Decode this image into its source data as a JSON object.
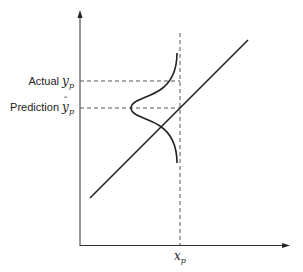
{
  "diagram": {
    "labels": {
      "actual_prefix": "Actual",
      "actual_symbol": "y",
      "actual_sub": "p",
      "prediction_prefix": "Prediction",
      "prediction_symbol": "y",
      "prediction_sub": "p",
      "x_symbol": "x",
      "x_sub": "p"
    },
    "elements": {
      "y_axis": "vertical axis with arrow",
      "x_axis": "horizontal axis with arrow",
      "regression_line": "straight fitted line",
      "vertical_dashed": "dashed line at x_p",
      "actual_dashed": "dashed line at actual y_p",
      "prediction_dashed": "dashed line at predicted y-hat_p",
      "distribution": "normal (bell) curve centered at predicted value, opening to the left"
    },
    "colors": {
      "stroke": "#222222",
      "dashed": "#555555",
      "background": "#ffffff"
    }
  }
}
